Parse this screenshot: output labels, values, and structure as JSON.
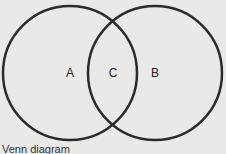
{
  "diagram": {
    "type": "venn",
    "circles": [
      {
        "label": "A",
        "cx": 70,
        "cy": 73,
        "r": 67
      },
      {
        "label": "B",
        "cx": 155,
        "cy": 73,
        "r": 67
      }
    ],
    "regions": {
      "a_only": "A",
      "intersection": "C",
      "b_only": "B"
    },
    "stroke_color": "#2b2b2b",
    "background": "#e9e9e8"
  },
  "caption": "Venn diagram"
}
